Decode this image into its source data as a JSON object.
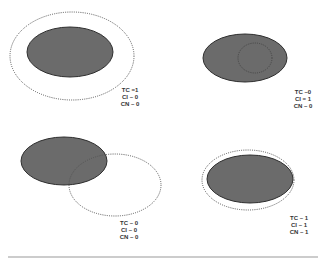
{
  "colors": {
    "filled": "#6b6b6b",
    "stroke": "#2e2e2e",
    "dotted": "#555555",
    "rule": "#999999",
    "text": "#333333"
  },
  "panels": [
    {
      "id": "top-left",
      "filled": {
        "cx": 70,
        "cy": 52,
        "rx": 43,
        "ry": 25
      },
      "dotted": {
        "cx": 72,
        "cy": 56,
        "rx": 62,
        "ry": 44
      },
      "labels": [
        "TC =1",
        "CI – 0",
        "CN – 0"
      ]
    },
    {
      "id": "top-right",
      "filled": {
        "cx": 245,
        "cy": 58,
        "rx": 42,
        "ry": 24
      },
      "dotted": {
        "cx": 255,
        "cy": 58,
        "rx": 17,
        "ry": 15
      },
      "labels": [
        "TC –0",
        "CI = 1",
        "CN – 0"
      ]
    },
    {
      "id": "bottom-left",
      "filled": {
        "cx": 64,
        "cy": 161,
        "rx": 43,
        "ry": 24
      },
      "dotted": {
        "cx": 115,
        "cy": 185,
        "rx": 46,
        "ry": 31
      },
      "labels": [
        "TC – 0",
        "CI – 0",
        "CN – 0"
      ]
    },
    {
      "id": "bottom-right",
      "filled": {
        "cx": 250,
        "cy": 179,
        "rx": 43,
        "ry": 24
      },
      "dotted": {
        "cx": 248,
        "cy": 180,
        "rx": 46,
        "ry": 30
      },
      "labels": [
        "TC – 1",
        "CI – 1",
        "CN – 1"
      ]
    }
  ]
}
